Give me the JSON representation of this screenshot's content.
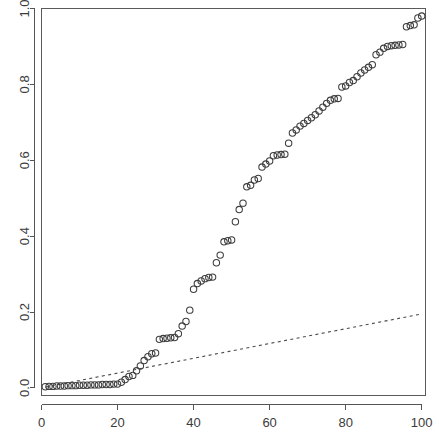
{
  "chart_data": {
    "type": "scatter",
    "title": "",
    "subtitle": "",
    "xlabel": "",
    "ylabel": "",
    "xlim": [
      0,
      101
    ],
    "ylim": [
      -0.02,
      1.0
    ],
    "grid": false,
    "legend": null,
    "xticks": [
      0,
      20,
      40,
      60,
      80,
      100
    ],
    "xtick_labels": [
      "0",
      "20",
      "40",
      "60",
      "80",
      "100"
    ],
    "yticks": [
      0.0,
      0.2,
      0.4,
      0.6,
      0.8,
      1.0
    ],
    "ytick_labels": [
      "0.0",
      "0.2",
      "0.4",
      "0.6",
      "0.8",
      "1.0"
    ],
    "series": [
      {
        "name": "observed",
        "type": "scatter",
        "marker": "open-circle",
        "color": "#3d3d3d",
        "x": [
          1,
          2,
          3,
          4,
          5,
          6,
          7,
          8,
          9,
          10,
          11,
          12,
          13,
          14,
          15,
          16,
          17,
          18,
          19,
          20,
          21,
          22,
          23,
          24,
          25,
          26,
          27,
          28,
          29,
          30,
          31,
          32,
          33,
          34,
          35,
          36,
          37,
          38,
          39,
          40,
          41,
          42,
          43,
          44,
          45,
          46,
          47,
          48,
          49,
          50,
          51,
          52,
          53,
          54,
          55,
          56,
          57,
          58,
          59,
          60,
          61,
          62,
          63,
          64,
          65,
          66,
          67,
          68,
          69,
          70,
          71,
          72,
          73,
          74,
          75,
          76,
          77,
          78,
          79,
          80,
          81,
          82,
          83,
          84,
          85,
          86,
          87,
          88,
          89,
          90,
          91,
          92,
          93,
          94,
          95,
          96,
          97,
          98,
          99,
          100
        ],
        "y": [
          0.003,
          0.004,
          0.004,
          0.005,
          0.005,
          0.005,
          0.006,
          0.006,
          0.006,
          0.007,
          0.007,
          0.007,
          0.008,
          0.008,
          0.008,
          0.009,
          0.009,
          0.009,
          0.01,
          0.01,
          0.015,
          0.022,
          0.03,
          0.033,
          0.045,
          0.058,
          0.072,
          0.082,
          0.09,
          0.092,
          0.128,
          0.13,
          0.131,
          0.132,
          0.133,
          0.143,
          0.163,
          0.175,
          0.205,
          0.26,
          0.275,
          0.282,
          0.288,
          0.291,
          0.292,
          0.33,
          0.35,
          0.385,
          0.388,
          0.39,
          0.438,
          0.47,
          0.487,
          0.53,
          0.534,
          0.548,
          0.552,
          0.582,
          0.59,
          0.598,
          0.612,
          0.614,
          0.615,
          0.616,
          0.645,
          0.672,
          0.68,
          0.69,
          0.697,
          0.705,
          0.712,
          0.72,
          0.73,
          0.74,
          0.75,
          0.758,
          0.762,
          0.763,
          0.793,
          0.796,
          0.805,
          0.81,
          0.82,
          0.83,
          0.838,
          0.845,
          0.852,
          0.878,
          0.885,
          0.895,
          0.9,
          0.902,
          0.903,
          0.904,
          0.905,
          0.952,
          0.955,
          0.957,
          0.975,
          0.98
        ]
      }
    ],
    "reference_line": {
      "name": "uniform-reference",
      "type": "line",
      "style": "dashed",
      "color": "#4a4a4a",
      "x": [
        1,
        100
      ],
      "y": [
        0.002,
        0.195
      ]
    }
  },
  "figure": {
    "background": "#ffffff",
    "frame_color": "#5a5a5a",
    "axis_color": "#555555",
    "point_color": "#3d3d3d",
    "line_color": "#4a4a4a"
  }
}
